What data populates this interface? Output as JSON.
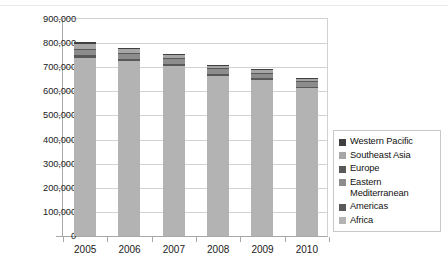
{
  "chart_data": {
    "type": "bar",
    "stacked": true,
    "title": "",
    "xlabel": "",
    "ylabel": "",
    "categories": [
      "2005",
      "2006",
      "2007",
      "2008",
      "2009",
      "2010"
    ],
    "ylim": [
      0,
      900000
    ],
    "ytick_values": [
      0,
      100000,
      200000,
      300000,
      400000,
      500000,
      600000,
      700000,
      800000,
      900000
    ],
    "ytick_labels": [
      "0",
      "100,000",
      "200,000",
      "300,000",
      "400,000",
      "500,000",
      "600,000",
      "700,000",
      "800,000",
      "900,000"
    ],
    "grid": true,
    "legend_position": "right",
    "series": [
      {
        "name": "Africa",
        "color": "#b3b3b3",
        "values": [
          740000,
          725000,
          705000,
          663000,
          645000,
          612000
        ]
      },
      {
        "name": "Americas",
        "color": "#595959",
        "values": [
          9000,
          9000,
          9000,
          9000,
          9000,
          8000
        ]
      },
      {
        "name": "Eastern Mediterranean",
        "color": "#8c8c8c",
        "values": [
          21000,
          20000,
          20000,
          19000,
          19000,
          18000
        ]
      },
      {
        "name": "Europe",
        "color": "#595959",
        "values": [
          6000,
          5000,
          5000,
          5000,
          5000,
          5000
        ]
      },
      {
        "name": "Southeast Asia",
        "color": "#a6a6a6",
        "values": [
          20000,
          15000,
          10000,
          9000,
          9000,
          8000
        ]
      },
      {
        "name": "Western Pacific",
        "color": "#404040",
        "values": [
          9000,
          8000,
          6000,
          5000,
          5000,
          4000
        ]
      }
    ],
    "totals": [
      805000,
      782000,
      755000,
      710000,
      692000,
      655000
    ],
    "legend_entries": [
      {
        "label": "Western Pacific",
        "color": "#404040"
      },
      {
        "label": "Southeast Asia",
        "color": "#a6a6a6"
      },
      {
        "label": "Europe",
        "color": "#595959"
      },
      {
        "label": "Eastern Mediterranean",
        "color": "#8c8c8c"
      },
      {
        "label": "Americas",
        "color": "#595959"
      },
      {
        "label": "Africa",
        "color": "#b3b3b3"
      }
    ]
  }
}
